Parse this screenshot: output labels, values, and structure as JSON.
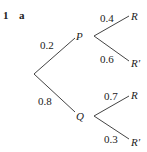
{
  "question": {
    "number": "1",
    "part": "a"
  },
  "tree": {
    "first_stage": [
      {
        "event": "P",
        "probability": "0.2"
      },
      {
        "event": "Q",
        "probability": "0.8"
      }
    ],
    "second_stage": {
      "P": [
        {
          "event": "R",
          "probability": "0.4"
        },
        {
          "event": "R′",
          "probability": "0.6"
        }
      ],
      "Q": [
        {
          "event": "R",
          "probability": "0.7"
        },
        {
          "event": "R′",
          "probability": "0.3"
        }
      ]
    }
  },
  "colors": {
    "line": "#444444",
    "text": "#222222"
  }
}
